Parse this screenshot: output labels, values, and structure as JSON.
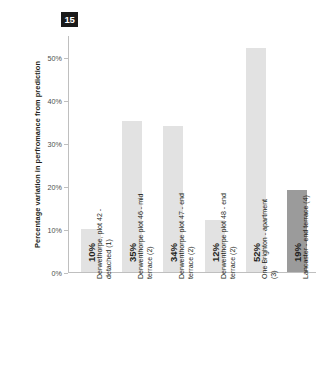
{
  "badge": {
    "label": "15"
  },
  "chart_data": {
    "type": "bar",
    "title": "",
    "xlabel": "",
    "ylabel": "Percentage variation in perfromance from prediction",
    "ylim": [
      0,
      55
    ],
    "grid": false,
    "legend": "none",
    "ytick_labels": [
      "0%",
      "10%",
      "20%",
      "30%",
      "40%",
      "50%"
    ],
    "ytick_values": [
      0,
      10,
      20,
      30,
      40,
      50
    ],
    "categories": [
      "Derwethorpe, plot 42 - detached (1)",
      "Derwenthorpe plot 46 - mid terrace (2)",
      "Derwenthorpe plot 47 - end terrace (2)",
      "Derwenthorpe plot 48 - end terrace (2)",
      "One Brighton - apartment (3)",
      "Lancaster - end terrace (4)"
    ],
    "values": [
      10,
      35,
      34,
      12,
      52,
      19
    ],
    "value_labels": [
      "10%",
      "35%",
      "34%",
      "12%",
      "52%",
      "19%"
    ],
    "bar_colors": [
      "#e2e2e2",
      "#e2e2e2",
      "#e2e2e2",
      "#e2e2e2",
      "#e2e2e2",
      "#9b9b9b"
    ]
  }
}
